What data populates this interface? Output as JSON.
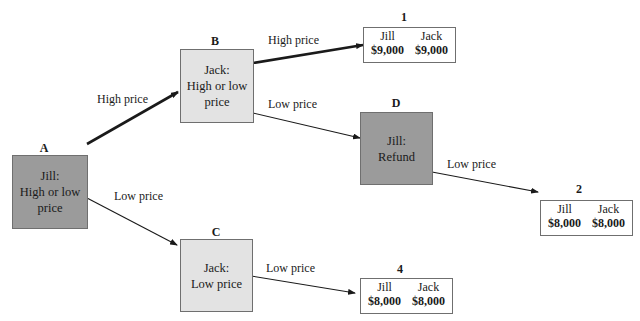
{
  "nodes": {
    "A": {
      "label": "A",
      "lines": [
        "Jill:",
        "High or low",
        "price"
      ]
    },
    "B": {
      "label": "B",
      "lines": [
        "Jack:",
        "High or low",
        "price"
      ]
    },
    "C": {
      "label": "C",
      "lines": [
        "Jack:",
        "Low price"
      ]
    },
    "D": {
      "label": "D",
      "lines": [
        "Jill:",
        "Refund"
      ]
    }
  },
  "edges": {
    "A_B": "High price",
    "A_C": "Low price",
    "B_1": "High price",
    "B_D": "Low price",
    "D_2": "Low price",
    "C_4": "Low price"
  },
  "outcomes": {
    "o1": {
      "label": "1",
      "players": [
        {
          "name": "Jill",
          "payoff": "$9,000"
        },
        {
          "name": "Jack",
          "payoff": "$9,000"
        }
      ]
    },
    "o2": {
      "label": "2",
      "players": [
        {
          "name": "Jill",
          "payoff": "$8,000"
        },
        {
          "name": "Jack",
          "payoff": "$8,000"
        }
      ]
    },
    "o4": {
      "label": "4",
      "players": [
        {
          "name": "Jill",
          "payoff": "$8,000"
        },
        {
          "name": "Jack",
          "payoff": "$8,000"
        }
      ]
    }
  },
  "colors": {
    "decision_dark": "#9b9b9b",
    "decision_light": "#e3e3e3",
    "border": "#6f6f6f"
  }
}
